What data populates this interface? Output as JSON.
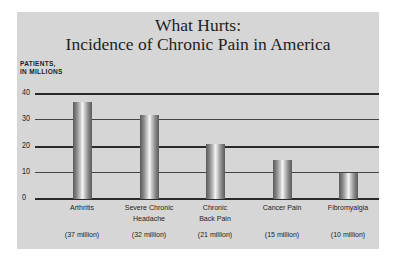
{
  "chart_data": {
    "type": "bar",
    "title": "What Hurts:",
    "subtitle": "Incidence of Chronic Pain in America",
    "ylabel_line1": "PATIENTS,",
    "ylabel_line2": "IN MILLIONS",
    "xlabel": "",
    "ylim": [
      0,
      40
    ],
    "yticks": [
      "40",
      "30",
      "20",
      "10",
      "0"
    ],
    "grid": true,
    "categories": [
      "Arthritis",
      "Severe Chronic Headache",
      "Chronic Back Pain",
      "Cancer Pain",
      "Fibromyalgia"
    ],
    "category_lines": [
      [
        "Arthritis"
      ],
      [
        "Severe Chronic",
        "Headache"
      ],
      [
        "Chronic",
        "Back Pain"
      ],
      [
        "Cancer Pain"
      ],
      [
        "Fibromyalgia"
      ]
    ],
    "values": [
      37,
      32,
      21,
      15,
      10
    ],
    "value_labels": [
      "(37 million)",
      "(32 million)",
      "(21 million)",
      "(15 million)",
      "(10 million)"
    ],
    "colors": {
      "panel": "#d6d6d6",
      "gridline": "#2a2a2a",
      "bar": "#8a8a8a"
    }
  }
}
